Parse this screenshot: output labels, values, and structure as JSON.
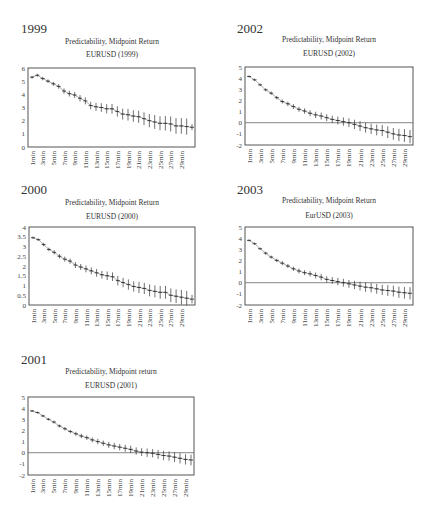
{
  "panels": [
    {
      "year_label": "1999",
      "title": "Predictability, Midpoint Return",
      "subtitle": "EURUSD (1999)"
    },
    {
      "year_label": "2002",
      "title": "Predictability, Midpoint Return",
      "subtitle": "EURUSD (2002)"
    },
    {
      "year_label": "2000",
      "title": "Predictability, Midpoint Return",
      "subtitle": "EURUSD (2000)"
    },
    {
      "year_label": "2003",
      "title": "Predictability, Midpoint Return",
      "subtitle": "EurUSD (2003)"
    },
    {
      "year_label": "2001",
      "title": "Predictability, Midpoint return",
      "subtitle": "EURUSD (2001)"
    }
  ],
  "chart_data": [
    {
      "type": "line",
      "title": "Predictability, Midpoint Return",
      "subtitle": "EURUSD (1999)",
      "xlabel": "",
      "ylabel": "",
      "x_tick_labels": [
        "1min",
        "3min",
        "5min",
        "7min",
        "9min",
        "11min",
        "13min",
        "15min",
        "17min",
        "19min",
        "21min",
        "23min",
        "25min",
        "27min",
        "29min"
      ],
      "ylim": [
        0,
        6
      ],
      "yticks": [
        "0",
        "1",
        "2",
        "3",
        "4",
        "5",
        "6"
      ],
      "zero_line": false,
      "error_bars": true,
      "x": [
        1,
        2,
        3,
        4,
        5,
        6,
        7,
        8,
        9,
        10,
        11,
        12,
        13,
        14,
        15,
        16,
        17,
        18,
        19,
        20,
        21,
        22,
        23,
        24,
        25,
        26,
        27,
        28,
        29,
        30
      ],
      "values": [
        5.3,
        5.45,
        5.2,
        5.0,
        4.8,
        4.6,
        4.25,
        4.05,
        3.95,
        3.7,
        3.5,
        3.15,
        3.05,
        3.0,
        2.9,
        2.9,
        2.7,
        2.5,
        2.45,
        2.35,
        2.3,
        2.15,
        2.0,
        1.9,
        1.8,
        1.8,
        1.75,
        1.6,
        1.6,
        1.55,
        1.5
      ],
      "error": [
        0.05,
        0.05,
        0.06,
        0.06,
        0.07,
        0.08,
        0.09,
        0.1,
        0.1,
        0.11,
        0.12,
        0.13,
        0.14,
        0.15,
        0.16,
        0.17,
        0.18,
        0.19,
        0.2,
        0.2,
        0.21,
        0.22,
        0.23,
        0.24,
        0.24,
        0.25,
        0.26,
        0.27,
        0.27,
        0.28
      ]
    },
    {
      "type": "line",
      "title": "Predictability, Midpoint Return",
      "subtitle": "EURUSD (2002)",
      "xlabel": "",
      "ylabel": "",
      "x_tick_labels": [
        "1min",
        "3min",
        "5min",
        "7min",
        "9min",
        "11min",
        "13min",
        "15min",
        "17min",
        "19min",
        "21min",
        "23min",
        "25min",
        "27min",
        "29min"
      ],
      "ylim": [
        -2,
        5
      ],
      "yticks": [
        "-2",
        "-1",
        "0",
        "1",
        "2",
        "3",
        "4",
        "5"
      ],
      "zero_line": true,
      "error_bars": true,
      "x": [
        1,
        2,
        3,
        4,
        5,
        6,
        7,
        8,
        9,
        10,
        11,
        12,
        13,
        14,
        15,
        16,
        17,
        18,
        19,
        20,
        21,
        22,
        23,
        24,
        25,
        26,
        27,
        28,
        29,
        30
      ],
      "values": [
        4.15,
        3.85,
        3.4,
        2.95,
        2.65,
        2.25,
        1.9,
        1.7,
        1.45,
        1.2,
        1.05,
        0.85,
        0.7,
        0.6,
        0.45,
        0.3,
        0.2,
        0.1,
        0.0,
        -0.15,
        -0.3,
        -0.45,
        -0.55,
        -0.65,
        -0.7,
        -0.85,
        -1.0,
        -1.1,
        -1.15,
        -1.25
      ],
      "error": [
        0.04,
        0.05,
        0.05,
        0.06,
        0.07,
        0.07,
        0.08,
        0.09,
        0.1,
        0.1,
        0.11,
        0.12,
        0.13,
        0.14,
        0.14,
        0.15,
        0.16,
        0.17,
        0.18,
        0.19,
        0.2,
        0.2,
        0.21,
        0.22,
        0.23,
        0.24,
        0.24,
        0.25,
        0.26,
        0.27
      ]
    },
    {
      "type": "line",
      "title": "Predictability, Midpoint Return",
      "subtitle": "EURUSD (2000)",
      "xlabel": "",
      "ylabel": "",
      "x_tick_labels": [
        "1min",
        "3min",
        "5min",
        "7min",
        "9min",
        "11min",
        "13min",
        "15min",
        "17min",
        "19min",
        "21min",
        "23min",
        "25min",
        "27min",
        "29min"
      ],
      "ylim": [
        0,
        4
      ],
      "yticks": [
        "0",
        "0.5",
        "1",
        "1.5",
        "2",
        "2.5",
        "3",
        "3.5",
        "4"
      ],
      "zero_line": false,
      "error_bars": true,
      "x": [
        1,
        2,
        3,
        4,
        5,
        6,
        7,
        8,
        9,
        10,
        11,
        12,
        13,
        14,
        15,
        16,
        17,
        18,
        19,
        20,
        21,
        22,
        23,
        24,
        25,
        26,
        27,
        28,
        29,
        30
      ],
      "values": [
        3.45,
        3.35,
        3.1,
        2.85,
        2.7,
        2.5,
        2.35,
        2.25,
        2.05,
        1.95,
        1.85,
        1.75,
        1.65,
        1.55,
        1.5,
        1.45,
        1.25,
        1.15,
        1.05,
        0.95,
        0.9,
        0.85,
        0.75,
        0.7,
        0.65,
        0.65,
        0.5,
        0.45,
        0.4,
        0.35,
        0.3
      ],
      "error": [
        0.03,
        0.03,
        0.04,
        0.04,
        0.05,
        0.05,
        0.06,
        0.06,
        0.07,
        0.07,
        0.08,
        0.08,
        0.09,
        0.09,
        0.1,
        0.1,
        0.11,
        0.11,
        0.12,
        0.12,
        0.13,
        0.13,
        0.14,
        0.14,
        0.15,
        0.15,
        0.16,
        0.16,
        0.17,
        0.17
      ]
    },
    {
      "type": "line",
      "title": "Predictability, Midpoint Return",
      "subtitle": "EurUSD (2003)",
      "xlabel": "",
      "ylabel": "",
      "x_tick_labels": [
        "1min",
        "3min",
        "5min",
        "7min",
        "9min",
        "11min",
        "13min",
        "15min",
        "17min",
        "19min",
        "21min",
        "23min",
        "25min",
        "27min",
        "29min"
      ],
      "ylim": [
        -2,
        5
      ],
      "yticks": [
        "-2",
        "-1",
        "0",
        "1",
        "2",
        "3",
        "4",
        "5"
      ],
      "zero_line": true,
      "error_bars": true,
      "x": [
        1,
        2,
        3,
        4,
        5,
        6,
        7,
        8,
        9,
        10,
        11,
        12,
        13,
        14,
        15,
        16,
        17,
        18,
        19,
        20,
        21,
        22,
        23,
        24,
        25,
        26,
        27,
        28,
        29,
        30
      ],
      "values": [
        3.8,
        3.5,
        3.05,
        2.65,
        2.3,
        2.0,
        1.75,
        1.5,
        1.25,
        1.05,
        0.9,
        0.8,
        0.65,
        0.5,
        0.3,
        0.2,
        0.1,
        0.0,
        -0.1,
        -0.2,
        -0.3,
        -0.4,
        -0.45,
        -0.55,
        -0.65,
        -0.7,
        -0.75,
        -0.85,
        -0.9,
        -0.95
      ],
      "error": [
        0.04,
        0.05,
        0.05,
        0.06,
        0.06,
        0.07,
        0.08,
        0.08,
        0.09,
        0.1,
        0.1,
        0.11,
        0.12,
        0.13,
        0.13,
        0.14,
        0.15,
        0.16,
        0.16,
        0.17,
        0.18,
        0.19,
        0.19,
        0.2,
        0.21,
        0.22,
        0.22,
        0.23,
        0.24,
        0.25
      ]
    },
    {
      "type": "line",
      "title": "Predictability, Midpoint return",
      "subtitle": "EURUSD (2001)",
      "xlabel": "",
      "ylabel": "",
      "x_tick_labels": [
        "1min",
        "3min",
        "5min",
        "7min",
        "9min",
        "11min",
        "13min",
        "15min",
        "17min",
        "19min",
        "21min",
        "23min",
        "25min",
        "27min",
        "29min"
      ],
      "ylim": [
        -2,
        5
      ],
      "yticks": [
        "-2",
        "-1",
        "0",
        "1",
        "2",
        "3",
        "4",
        "5"
      ],
      "zero_line": true,
      "error_bars": true,
      "x": [
        1,
        2,
        3,
        4,
        5,
        6,
        7,
        8,
        9,
        10,
        11,
        12,
        13,
        14,
        15,
        16,
        17,
        18,
        19,
        20,
        21,
        22,
        23,
        24,
        25,
        26,
        27,
        28,
        29,
        30
      ],
      "values": [
        3.75,
        3.6,
        3.3,
        3.0,
        2.75,
        2.4,
        2.15,
        1.9,
        1.7,
        1.5,
        1.35,
        1.15,
        1.0,
        0.85,
        0.7,
        0.6,
        0.5,
        0.4,
        0.3,
        0.15,
        0.05,
        0.0,
        -0.05,
        -0.15,
        -0.25,
        -0.3,
        -0.4,
        -0.5,
        -0.6,
        -0.65
      ],
      "error": [
        0.04,
        0.04,
        0.05,
        0.05,
        0.06,
        0.06,
        0.07,
        0.07,
        0.08,
        0.09,
        0.09,
        0.1,
        0.11,
        0.11,
        0.12,
        0.13,
        0.13,
        0.14,
        0.15,
        0.15,
        0.16,
        0.17,
        0.17,
        0.18,
        0.19,
        0.19,
        0.2,
        0.21,
        0.21,
        0.22
      ]
    }
  ]
}
